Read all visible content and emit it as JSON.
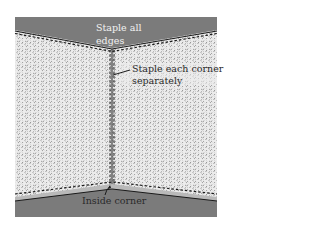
{
  "diagram": {
    "labels": {
      "top_line1": "Staple all",
      "top_line2": "edges",
      "right_line1": "Staple each corner",
      "right_line2": "separately",
      "bottom": "Inside corner"
    },
    "colors": {
      "ceiling": "#7b7b7b",
      "floor": "#7b7b7b",
      "floor_trim": "#b9b9b9",
      "wall": "#e6e6e6",
      "speckle": "#8c8c8c",
      "staple_line": "#1a1a1a"
    }
  }
}
